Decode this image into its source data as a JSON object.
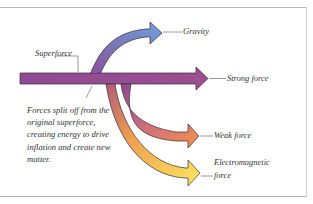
{
  "diagram": {
    "source_label": "Superforce",
    "branches": [
      {
        "label": "Gravity",
        "color_start": "#8c5ea8",
        "color_end": "#6f9fd8"
      },
      {
        "label": "Strong force",
        "color_start": "#8c4a92",
        "color_end": "#9a4f90"
      },
      {
        "label": "Weak force",
        "color_start": "#9b4e8c",
        "color_end": "#f08a48"
      },
      {
        "label": "Electromagnetic force",
        "line1": "Electromagnetic",
        "line2": "force",
        "color_start": "#c06a6a",
        "color_end": "#f8e050"
      }
    ],
    "note": "Forces split off from the original superforce, creating energy to drive inflation and create new matter.",
    "colors": {
      "superforce": "#8e4a93",
      "outline": "#3a2a3a",
      "leader": "#555555",
      "frame": "#b8b8b8"
    }
  }
}
